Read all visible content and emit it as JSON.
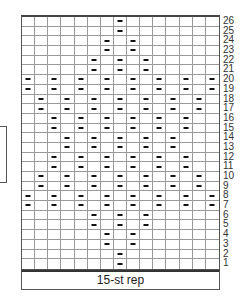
{
  "chart": {
    "columns": 15,
    "rows": 26,
    "footer_label": "15-st rep",
    "symbol": "purl-dash",
    "rows_data": [
      {
        "row": 26,
        "purls": [
          7
        ]
      },
      {
        "row": 25,
        "purls": [
          7
        ]
      },
      {
        "row": 24,
        "purls": [
          6,
          8
        ]
      },
      {
        "row": 23,
        "purls": [
          6,
          8
        ]
      },
      {
        "row": 22,
        "purls": [
          5,
          7,
          9
        ]
      },
      {
        "row": 21,
        "purls": [
          5,
          7,
          9
        ]
      },
      {
        "row": 20,
        "purls": [
          0,
          2,
          4,
          6,
          8,
          10,
          12,
          14
        ]
      },
      {
        "row": 19,
        "purls": [
          0,
          2,
          4,
          6,
          8,
          10,
          12,
          14
        ]
      },
      {
        "row": 18,
        "purls": [
          1,
          3,
          5,
          7,
          9,
          11,
          13
        ]
      },
      {
        "row": 17,
        "purls": [
          1,
          3,
          5,
          7,
          9,
          11,
          13
        ]
      },
      {
        "row": 16,
        "purls": [
          2,
          4,
          6,
          8,
          10,
          12
        ]
      },
      {
        "row": 15,
        "purls": [
          2,
          4,
          6,
          8,
          10,
          12
        ]
      },
      {
        "row": 14,
        "purls": [
          3,
          5,
          7,
          9,
          11
        ]
      },
      {
        "row": 13,
        "purls": [
          3,
          5,
          7,
          9,
          11
        ]
      },
      {
        "row": 12,
        "purls": [
          2,
          4,
          6,
          8,
          10,
          12
        ]
      },
      {
        "row": 11,
        "purls": [
          2,
          4,
          6,
          8,
          10,
          12
        ]
      },
      {
        "row": 10,
        "purls": [
          1,
          3,
          5,
          7,
          9,
          11,
          13
        ]
      },
      {
        "row": 9,
        "purls": [
          1,
          3,
          5,
          7,
          9,
          11,
          13
        ]
      },
      {
        "row": 8,
        "purls": [
          0,
          2,
          4,
          6,
          8,
          10,
          12,
          14
        ]
      },
      {
        "row": 7,
        "purls": [
          0,
          2,
          4,
          6,
          8,
          10,
          12,
          14
        ]
      },
      {
        "row": 6,
        "purls": [
          5,
          7,
          9
        ]
      },
      {
        "row": 5,
        "purls": [
          5,
          7,
          9
        ]
      },
      {
        "row": 4,
        "purls": [
          6,
          8
        ]
      },
      {
        "row": 3,
        "purls": [
          6,
          8
        ]
      },
      {
        "row": 2,
        "purls": [
          7
        ]
      },
      {
        "row": 1,
        "purls": [
          7
        ]
      }
    ]
  }
}
